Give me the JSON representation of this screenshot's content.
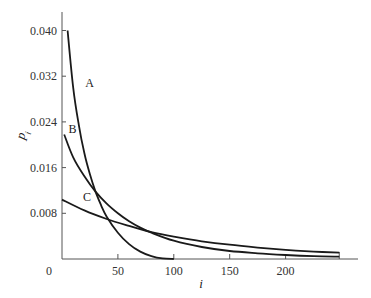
{
  "chart_data": {
    "type": "line",
    "title": "",
    "xlabel": "i",
    "ylabel": "p_i",
    "xlim": [
      0,
      260
    ],
    "ylim": [
      0,
      0.044
    ],
    "grid": false,
    "legend": "none (curves labeled inline A, B, C)",
    "x_ticks": [
      0,
      50,
      100,
      150,
      200
    ],
    "x_tick_labels": [
      "0",
      "50",
      "100",
      "150",
      "200"
    ],
    "y_ticks": [
      0.008,
      0.016,
      0.024,
      0.032,
      0.04
    ],
    "y_tick_labels": [
      "0.008",
      "0.016",
      "0.024",
      "0.032",
      "0.040"
    ],
    "origin_label": "0",
    "series": [
      {
        "name": "A",
        "x": [
          5,
          10,
          15,
          20,
          25,
          30,
          35,
          40,
          50,
          60,
          70,
          80,
          90,
          100
        ],
        "values": [
          0.04,
          0.03,
          0.0235,
          0.0185,
          0.0148,
          0.0118,
          0.0094,
          0.0074,
          0.0046,
          0.0026,
          0.0013,
          0.0005,
          0.0001,
          0.0
        ]
      },
      {
        "name": "B",
        "x": [
          2,
          10,
          20,
          30,
          40,
          50,
          60,
          70,
          80,
          100,
          125,
          150,
          175,
          200,
          225,
          248
        ],
        "values": [
          0.0218,
          0.0178,
          0.0145,
          0.0118,
          0.0097,
          0.008,
          0.0066,
          0.0055,
          0.0046,
          0.0032,
          0.0021,
          0.0014,
          0.001,
          0.0007,
          0.0005,
          0.0004
        ]
      },
      {
        "name": "C",
        "x": [
          0,
          20,
          40,
          60,
          80,
          100,
          125,
          150,
          175,
          200,
          225,
          248
        ],
        "values": [
          0.0104,
          0.0085,
          0.007,
          0.0058,
          0.0047,
          0.0039,
          0.0031,
          0.0025,
          0.002,
          0.0016,
          0.0013,
          0.0011
        ]
      }
    ],
    "annotations": [
      {
        "text": "A",
        "x": 20,
        "y": 0.03
      },
      {
        "text": "B",
        "x": 5,
        "y": 0.0218
      },
      {
        "text": "C",
        "x": 18,
        "y": 0.01
      }
    ]
  }
}
